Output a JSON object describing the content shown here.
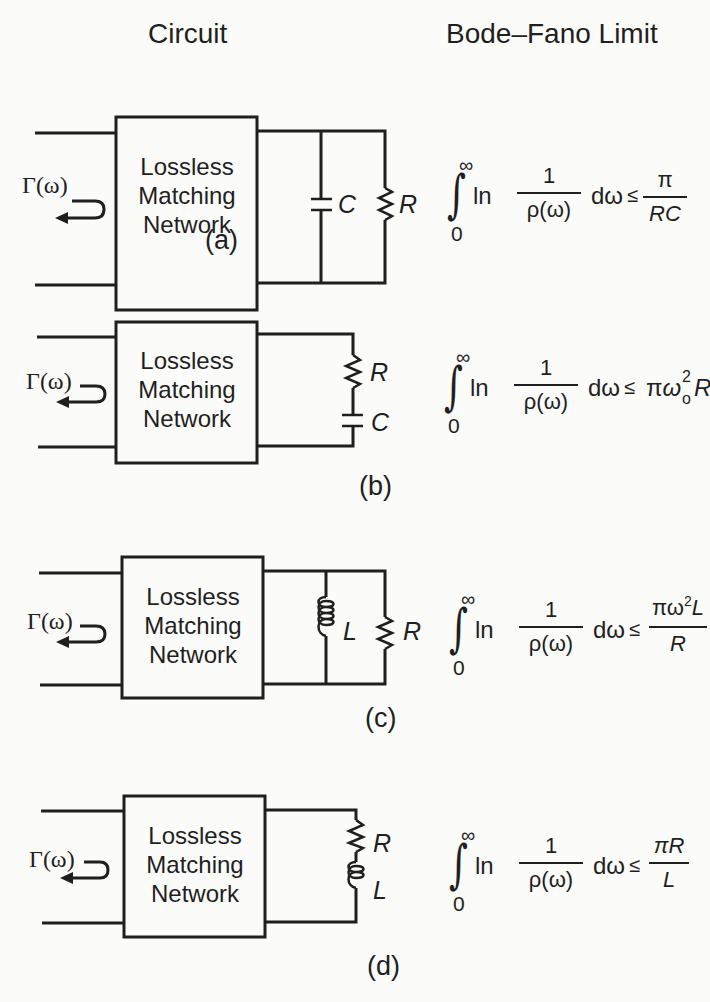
{
  "headers": {
    "circuit": "Circuit",
    "limit": "Bode–Fano Limit"
  },
  "common": {
    "network_lines": [
      "Lossless",
      "Matching",
      "Network"
    ],
    "gamma": "Γ(ω)",
    "integral_sign": "∫",
    "upper_limit": "∞",
    "lower_limit": "0",
    "ln": "ln",
    "numerator": "1",
    "denominator": "ρ(ω)",
    "dw": "dω",
    "leq": "≤"
  },
  "panels": [
    {
      "id": "a",
      "caption": "(a)",
      "topology": "parallel RC",
      "components": [
        "C",
        "R"
      ],
      "rhs": {
        "type": "fraction",
        "num": "π",
        "den": "RC"
      }
    },
    {
      "id": "b",
      "caption": "(b)",
      "topology": "series RC",
      "components": [
        "R",
        "C"
      ],
      "rhs": {
        "type": "inline",
        "pi": "π",
        "omega": "ω",
        "sup": "2",
        "sub": "o",
        "tail": "RC"
      }
    },
    {
      "id": "c",
      "caption": "(c)",
      "topology": "parallel RL",
      "components": [
        "L",
        "R"
      ],
      "rhs": {
        "type": "fraction",
        "num_pi": "πω",
        "sup": "2",
        "sub": "o",
        "num_tail": "L",
        "den": "R"
      }
    },
    {
      "id": "d",
      "caption": "(d)",
      "topology": "series RL",
      "components": [
        "R",
        "L"
      ],
      "rhs": {
        "type": "fraction",
        "num": "πR",
        "den": "L"
      }
    }
  ]
}
